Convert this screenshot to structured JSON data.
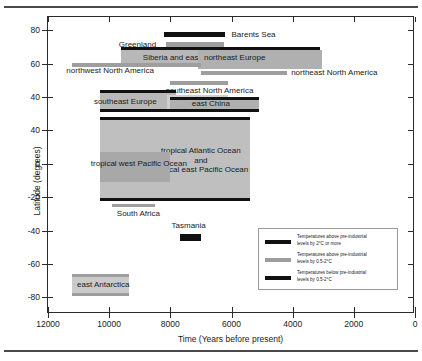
{
  "figure": {
    "rules": [
      "top-rule",
      "bottom-rule"
    ]
  },
  "chart_data": {
    "type": "bar",
    "title": "",
    "xlabel": "Time (Years before present)",
    "ylabel": "Latitude (degrees)",
    "xlim": [
      12000,
      0
    ],
    "ylim": [
      -90,
      88
    ],
    "x_reversed": true,
    "grid": false,
    "xticks": [
      12000,
      10000,
      8000,
      6000,
      4000,
      2000,
      0
    ],
    "xticklabels": [
      "12000",
      "10000",
      "8000",
      "6000",
      "4000",
      "2000",
      "0"
    ],
    "yticks": [
      80,
      60,
      40,
      20,
      0,
      -20,
      -40,
      -60,
      -80
    ],
    "yticklabels": [
      "80",
      "60",
      "40",
      "40",
      "0",
      "-20",
      "-40",
      "-60",
      "-80"
    ],
    "legend_position": "lower right",
    "legend": [
      {
        "key": "above-2c",
        "color": "#111111",
        "label_line1": "Temperatures above pre-industrial",
        "label_line2": "levels by 2°C or more"
      },
      {
        "key": "above-0p5-2c",
        "color": "#9e9e9e",
        "label_line1": "Temperatures above pre-industrial",
        "label_line2": "levels by 0.5-2°C"
      },
      {
        "key": "below-0p5-2c",
        "color": "#111111",
        "label_line1": "Temperatures below pre-industrial",
        "label_line2": "levels by 0.5-2°C"
      }
    ],
    "bands": [
      {
        "name": "Barents Sea",
        "x_start": 8200,
        "x_end": 6200,
        "lat_top": 79,
        "lat_bottom": 76,
        "style": "solid-dark",
        "fill": "none",
        "edge_color": "#111111",
        "label_x": 6000,
        "label_lat": 77.5,
        "label_anchor": "left"
      },
      {
        "name": "Greenland",
        "x_start": 8150,
        "x_end": 6250,
        "lat_top": 73,
        "lat_bottom": 70,
        "style": "solid-gray",
        "fill": "none",
        "edge_color": "#9e9e9e",
        "label_x": 8400,
        "label_lat": 71.5,
        "label_anchor": "right"
      },
      {
        "name": "Siberia and east Russia",
        "x_start": 9600,
        "x_end": 3100,
        "lat_top": 70,
        "lat_bottom": 58,
        "style": "filled",
        "fill": "#b8b8b8",
        "edge_color": "#111111",
        "label_x": 8900,
        "label_lat": 63.5,
        "label_anchor": "left"
      },
      {
        "name": "northeast Europe",
        "x_start": 7100,
        "x_end": 3050,
        "lat_top": 68,
        "lat_bottom": 57,
        "style": "filled-overlap",
        "fill": "#b0b0b0",
        "edge_color": "none",
        "label_x": 6900,
        "label_lat": 63.5,
        "label_anchor": "left"
      },
      {
        "name": "northwest North America",
        "x_start": 11200,
        "x_end": 7000,
        "lat_top": 60,
        "lat_bottom": 59,
        "style": "solid-gray",
        "fill": "none",
        "edge_color": "#9e9e9e",
        "label_x": 11400,
        "label_lat": 55.5,
        "label_anchor": "left"
      },
      {
        "name": "northeast North America",
        "x_start": 7000,
        "x_end": 4200,
        "lat_top": 55,
        "lat_bottom": 54,
        "style": "solid-gray",
        "fill": "none",
        "edge_color": "#9e9e9e",
        "label_x": 4050,
        "label_lat": 54.5,
        "label_anchor": "left"
      },
      {
        "name": "southeast North America",
        "x_start": 8000,
        "x_end": 6100,
        "lat_top": 49,
        "lat_bottom": 48,
        "style": "solid-gray",
        "fill": "none",
        "edge_color": "#9e9e9e",
        "label_x": 8150,
        "label_lat": 43.5,
        "label_anchor": "left"
      },
      {
        "name": "southeast Europe",
        "x_start": 10300,
        "x_end": 7800,
        "lat_top": 44,
        "lat_bottom": 31,
        "style": "filled",
        "fill": "#b8b8b8",
        "edge_color": "#111111",
        "label_x": 10500,
        "label_lat": 37,
        "label_anchor": "left"
      },
      {
        "name": "west China",
        "x_start": 8100,
        "x_end": 6100,
        "lat_top": 41,
        "lat_bottom": 33,
        "style": "filled-light",
        "fill": "#cfcfcf",
        "edge_color": "none",
        "label_x": 8000,
        "label_lat": 36.5,
        "label_anchor": "left"
      },
      {
        "name": "east China",
        "x_start": 8000,
        "x_end": 5100,
        "lat_top": 40,
        "lat_bottom": 31,
        "style": "filled",
        "fill": "#b0b0b0",
        "edge_color": "#111111",
        "label_x": 7300,
        "label_lat": 36,
        "label_anchor": "left"
      },
      {
        "name": "tropical Atlantic Ocean and tropical east Pacific Ocean",
        "label_line1": "tropical Atlantic Ocean",
        "label_line2": "and",
        "label_line3": "tropical east Pacific Ocean",
        "x_start": 10300,
        "x_end": 5400,
        "lat_top": 28,
        "lat_bottom": -22,
        "style": "filled",
        "fill": "#bfbfbf",
        "edge_color": "#111111",
        "label_x": 7000,
        "label_lat": 2,
        "label_anchor": "center"
      },
      {
        "name": "tropical west Pacific Ocean",
        "x_start": 10300,
        "x_end": 8000,
        "lat_top": 7,
        "lat_bottom": -11,
        "style": "filled-dark",
        "fill": "#a8a8a8",
        "edge_color": "none",
        "label_x": 10600,
        "label_lat": 0,
        "label_anchor": "left"
      },
      {
        "name": "South Africa",
        "x_start": 9900,
        "x_end": 8500,
        "lat_top": -24,
        "lat_bottom": -26,
        "style": "solid-gray",
        "fill": "none",
        "edge_color": "#9e9e9e",
        "label_x": 9750,
        "label_lat": -30,
        "label_anchor": "left"
      },
      {
        "name": "Tasmania",
        "x_start": 7700,
        "x_end": 7000,
        "lat_top": -42,
        "lat_bottom": -46,
        "style": "solid-dark",
        "fill": "none",
        "edge_color": "#111111",
        "label_x": 7400,
        "label_lat": -37,
        "label_anchor": "center"
      },
      {
        "name": "east Antarctica",
        "x_start": 11200,
        "x_end": 9350,
        "lat_top": -66,
        "lat_bottom": -79,
        "style": "filled",
        "fill": "#cacaca",
        "edge_color": "#9e9e9e",
        "label_x": 11050,
        "label_lat": -72.5,
        "label_anchor": "left"
      }
    ]
  }
}
